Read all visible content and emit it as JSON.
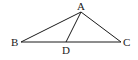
{
  "diagram": {
    "type": "geometry-triangle",
    "colors": {
      "stroke": "#1a1a1a",
      "text": "#222222",
      "background": "#ffffff"
    },
    "points": {
      "A": {
        "label": "A",
        "x": 81,
        "y": 12
      },
      "B": {
        "label": "B",
        "x": 21,
        "y": 42
      },
      "C": {
        "label": "C",
        "x": 121,
        "y": 42
      },
      "D": {
        "label": "D",
        "x": 66,
        "y": 42
      }
    },
    "segments": [
      {
        "from": "A",
        "to": "B"
      },
      {
        "from": "A",
        "to": "C"
      },
      {
        "from": "B",
        "to": "C"
      },
      {
        "from": "A",
        "to": "D"
      }
    ]
  }
}
